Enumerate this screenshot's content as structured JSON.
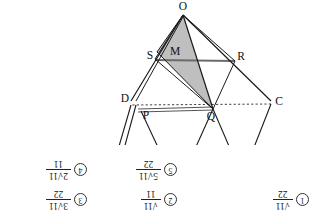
{
  "figure": {
    "caption": "Solid geometry figure: pyramid with apex O, base/plane points C, Q, P, D, R, S and midpoint M; triangle Q-M-O is shaded gray.",
    "shade_color": "#bfbfbf",
    "line_color": "#1a1a1a",
    "vertices": [
      {
        "label": "C",
        "x": 48,
        "y": 43
      },
      {
        "label": "Q",
        "x": 116,
        "y": 31
      },
      {
        "label": "P",
        "x": 181,
        "y": 30
      },
      {
        "label": "D",
        "x": 199,
        "y": 45
      },
      {
        "label": "R",
        "x": 87,
        "y": 87
      },
      {
        "label": "M",
        "x": 152,
        "y": 92
      },
      {
        "label": "S",
        "x": 174,
        "y": 88
      },
      {
        "label": "O",
        "x": 144,
        "y": 133
      }
    ]
  },
  "choices": [
    {
      "id": "opt3",
      "number": "3",
      "numerator": "3√11",
      "denominator": "22"
    },
    {
      "id": "opt5",
      "number": "5",
      "numerator": "5√11",
      "denominator": "22"
    },
    {
      "id": "opt4",
      "number": "4",
      "numerator": "2√11",
      "denominator": "11"
    },
    {
      "id": "opt2",
      "number": "2",
      "numerator": "√11",
      "denominator": "11"
    },
    {
      "id": "opt1",
      "number": "1",
      "numerator": "√11",
      "denominator": "22"
    }
  ]
}
